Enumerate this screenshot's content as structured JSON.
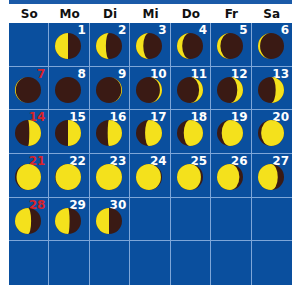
{
  "colors": {
    "grid_bg": "#0a4f9e",
    "grid_line": "#7ea6d8",
    "moon_lit": "#f4e11c",
    "moon_dark": "#3a1a14",
    "sunday_num": "#d8232a",
    "num": "#ffffff"
  },
  "weekdays": [
    "So",
    "Mo",
    "Di",
    "Mi",
    "Do",
    "Fr",
    "Sa"
  ],
  "first_weekday_index": 1,
  "days": [
    {
      "day": "1",
      "illum": 0.5,
      "lit": "left"
    },
    {
      "day": "2",
      "illum": 0.38,
      "lit": "left"
    },
    {
      "day": "3",
      "illum": 0.28,
      "lit": "left"
    },
    {
      "day": "4",
      "illum": 0.2,
      "lit": "left"
    },
    {
      "day": "5",
      "illum": 0.13,
      "lit": "left"
    },
    {
      "day": "6",
      "illum": 0.08,
      "lit": "left"
    },
    {
      "day": "7",
      "illum": 0.03,
      "lit": "left"
    },
    {
      "day": "8",
      "illum": 0.0,
      "lit": "right"
    },
    {
      "day": "9",
      "illum": 0.03,
      "lit": "right"
    },
    {
      "day": "10",
      "illum": 0.08,
      "lit": "right"
    },
    {
      "day": "11",
      "illum": 0.15,
      "lit": "right"
    },
    {
      "day": "12",
      "illum": 0.22,
      "lit": "right"
    },
    {
      "day": "13",
      "illum": 0.32,
      "lit": "right"
    },
    {
      "day": "14",
      "illum": 0.45,
      "lit": "right"
    },
    {
      "day": "15",
      "illum": 0.5,
      "lit": "right"
    },
    {
      "day": "16",
      "illum": 0.55,
      "lit": "right"
    },
    {
      "day": "17",
      "illum": 0.65,
      "lit": "right"
    },
    {
      "day": "18",
      "illum": 0.74,
      "lit": "right"
    },
    {
      "day": "19",
      "illum": 0.82,
      "lit": "right"
    },
    {
      "day": "20",
      "illum": 0.88,
      "lit": "right"
    },
    {
      "day": "21",
      "illum": 0.94,
      "lit": "right"
    },
    {
      "day": "22",
      "illum": 0.98,
      "lit": "right"
    },
    {
      "day": "23",
      "illum": 1.0,
      "lit": "right"
    },
    {
      "day": "24",
      "illum": 0.96,
      "lit": "left"
    },
    {
      "day": "25",
      "illum": 0.92,
      "lit": "left"
    },
    {
      "day": "26",
      "illum": 0.86,
      "lit": "left"
    },
    {
      "day": "27",
      "illum": 0.76,
      "lit": "left"
    },
    {
      "day": "28",
      "illum": 0.62,
      "lit": "left"
    },
    {
      "day": "29",
      "illum": 0.56,
      "lit": "left"
    },
    {
      "day": "30",
      "illum": 0.5,
      "lit": "left"
    }
  ]
}
